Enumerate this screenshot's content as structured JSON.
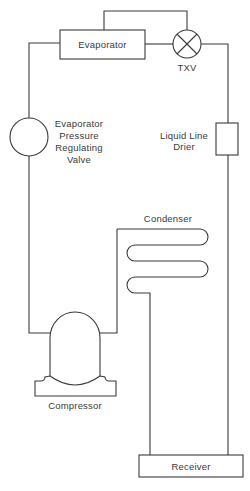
{
  "diagram": {
    "components": {
      "evaporator": {
        "label": "Evaporator"
      },
      "txv": {
        "label": "TXV"
      },
      "epr_valve": {
        "label_lines": [
          "Evaporator",
          "Pressure",
          "Regulating",
          "Valve"
        ]
      },
      "drier": {
        "label_lines": [
          "Liquid Line",
          "Drier"
        ]
      },
      "condenser": {
        "label": "Condenser"
      },
      "compressor": {
        "label": "Compressor"
      },
      "receiver": {
        "label": "Receiver"
      }
    },
    "colors": {
      "line": "#3a3a3a",
      "background": "#ffffff"
    }
  }
}
